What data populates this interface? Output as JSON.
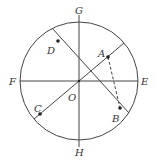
{
  "diagram": {
    "type": "circle-geometry",
    "center": {
      "label": "O",
      "x": 79,
      "y": 81
    },
    "radius": 59,
    "stroke_color": "#333333",
    "axes": [
      {
        "name": "vertical-diameter",
        "from": "G",
        "to": "H"
      },
      {
        "name": "horizontal-diameter",
        "from": "F",
        "to": "E"
      }
    ],
    "chords": [
      {
        "name": "diameter-AC",
        "through": [
          "A",
          "O",
          "C"
        ],
        "style": "solid"
      },
      {
        "name": "diameter-DB",
        "through": [
          "D",
          "O",
          "B"
        ],
        "style": "solid"
      },
      {
        "name": "segment-AB",
        "through": [
          "A",
          "B"
        ],
        "style": "dashed"
      }
    ],
    "labels": {
      "G": "G",
      "H": "H",
      "E": "E",
      "F": "F",
      "O": "O",
      "A": "A",
      "B": "B",
      "C": "C",
      "D": "D"
    },
    "points": [
      {
        "label": "A",
        "x": 108,
        "y": 57
      },
      {
        "label": "B",
        "x": 120,
        "y": 108
      },
      {
        "label": "C",
        "x": 40,
        "y": 114
      },
      {
        "label": "D",
        "x": 58,
        "y": 41
      }
    ]
  }
}
